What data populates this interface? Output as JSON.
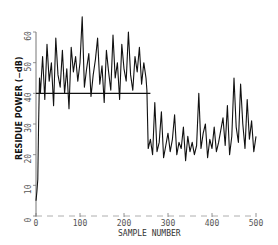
{
  "chart_data": {
    "type": "line",
    "title": "",
    "xlabel": "SAMPLE NUMBER",
    "ylabel": "RESIDUE POWER (−dB)",
    "xlim": [
      0,
      500
    ],
    "ylim": [
      0,
      60
    ],
    "x_ticks": [
      0,
      100,
      200,
      300,
      400,
      500
    ],
    "x_tick_labels": [
      "0",
      "100",
      "200",
      "300",
      "400",
      "500"
    ],
    "y_ticks": [
      0,
      10,
      20,
      30,
      40,
      50,
      60
    ],
    "y_tick_labels": [
      "0",
      "10",
      "20",
      "30",
      "40",
      "50",
      "60"
    ],
    "grid": false,
    "reference_line": {
      "y": 40,
      "x_start": 0,
      "x_end": 260
    },
    "series": [
      {
        "name": "residue power",
        "x": [
          0,
          2,
          4,
          6,
          8,
          10,
          15,
          20,
          25,
          30,
          35,
          40,
          45,
          50,
          55,
          60,
          65,
          70,
          75,
          80,
          85,
          90,
          95,
          100,
          105,
          110,
          115,
          120,
          125,
          130,
          135,
          140,
          145,
          150,
          155,
          160,
          165,
          170,
          175,
          180,
          185,
          190,
          195,
          200,
          205,
          210,
          215,
          220,
          225,
          230,
          235,
          240,
          245,
          250,
          252,
          255,
          260,
          265,
          270,
          275,
          280,
          285,
          290,
          295,
          300,
          305,
          310,
          315,
          320,
          325,
          330,
          335,
          340,
          345,
          350,
          355,
          360,
          365,
          370,
          375,
          380,
          385,
          390,
          395,
          400,
          405,
          410,
          415,
          420,
          425,
          430,
          435,
          440,
          445,
          450,
          455,
          460,
          465,
          470,
          475,
          480,
          485,
          490,
          495,
          500
        ],
        "values": [
          5,
          8,
          12,
          30,
          45,
          40,
          52,
          38,
          56,
          44,
          50,
          36,
          58,
          46,
          42,
          54,
          40,
          48,
          35,
          55,
          47,
          52,
          44,
          50,
          65,
          42,
          48,
          53,
          39,
          46,
          51,
          58,
          43,
          49,
          37,
          54,
          47,
          41,
          59,
          45,
          50,
          38,
          56,
          48,
          44,
          60,
          46,
          41,
          52,
          47,
          55,
          43,
          50,
          45,
          41,
          22,
          25,
          20,
          37,
          21,
          24,
          34,
          19,
          23,
          27,
          21,
          25,
          33,
          20,
          24,
          22,
          29,
          18,
          26,
          21,
          24,
          20,
          23,
          40,
          22,
          27,
          30,
          19,
          25,
          22,
          29,
          21,
          24,
          28,
          32,
          23,
          36,
          20,
          26,
          45,
          29,
          24,
          43,
          30,
          22,
          38,
          25,
          31,
          21,
          26
        ]
      }
    ]
  }
}
